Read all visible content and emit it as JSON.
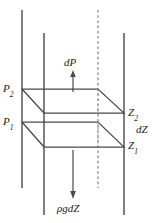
{
  "figure": {
    "type": "physics-schematic",
    "width": 161,
    "height": 223,
    "background_color": "#ffffff",
    "line_color": "#3b3b3b",
    "text_color": "#1a1a1a"
  },
  "labels": {
    "pressure_upper": "P",
    "pressure_upper_sub": "2",
    "pressure_lower": "P",
    "pressure_lower_sub": "1",
    "height_upper": "Z",
    "height_upper_sub": "2",
    "height_lower": "Z",
    "height_lower_sub": "1",
    "height_difference": "dZ",
    "pressure_difference": "dP",
    "weight_force": "ρgdZ"
  },
  "arrows": {
    "up_arrow_name": "dP",
    "up_arrow_direction": "up",
    "down_arrow_name": "ρgdZ",
    "down_arrow_direction": "down"
  },
  "geometry": {
    "vertical_lines": [
      {
        "name": "left-front-edge",
        "x": 22,
        "y1": 10,
        "y2": 188,
        "style": "solid"
      },
      {
        "name": "left-back-edge",
        "x": 44,
        "y1": 33,
        "y2": 215,
        "style": "solid"
      },
      {
        "name": "center-back-edge",
        "x": 98,
        "y1": 10,
        "y2": 188,
        "style": "dashed"
      },
      {
        "name": "right-back-edge",
        "x": 124,
        "y1": 33,
        "y2": 215,
        "style": "solid"
      }
    ],
    "top_face": {
      "name": "upper-parallelogram",
      "points": "22,89 98,89 124,113 44,113"
    },
    "bottom_face": {
      "name": "lower-parallelogram",
      "points": "22,122 98,122 124,147 44,147"
    }
  }
}
